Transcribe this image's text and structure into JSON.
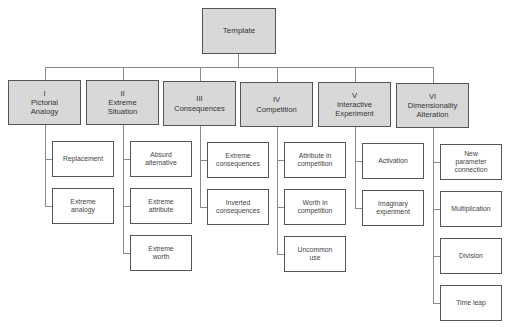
{
  "root": {
    "label": "Template"
  },
  "categories": [
    {
      "numeral": "I",
      "title": "Pictorial Analogy",
      "lines": [
        "I",
        "Pictorial",
        "Analogy"
      ],
      "children": [
        {
          "lines": [
            "Replacement"
          ]
        },
        {
          "lines": [
            "Extreme",
            "analogy"
          ]
        }
      ]
    },
    {
      "numeral": "II",
      "title": "Extreme Situation",
      "lines": [
        "II",
        "Extreme",
        "Situation"
      ],
      "children": [
        {
          "lines": [
            "Absurd",
            "alternative"
          ]
        },
        {
          "lines": [
            "Extreme",
            "attribute"
          ]
        },
        {
          "lines": [
            "Extreme",
            "worth"
          ]
        }
      ]
    },
    {
      "numeral": "III",
      "title": "Consequences",
      "lines": [
        "III",
        "Consequences"
      ],
      "children": [
        {
          "lines": [
            "Extreme",
            "consequences"
          ]
        },
        {
          "lines": [
            "Inverted",
            "consequences"
          ]
        }
      ]
    },
    {
      "numeral": "IV",
      "title": "Competition",
      "lines": [
        "IV",
        "Competition"
      ],
      "children": [
        {
          "lines": [
            "Attribute in",
            "competition"
          ]
        },
        {
          "lines": [
            "Worth in",
            "competition"
          ]
        },
        {
          "lines": [
            "Uncommon",
            "use"
          ]
        }
      ]
    },
    {
      "numeral": "V",
      "title": "Interactive Experiment",
      "lines": [
        "V",
        "Interactive",
        "Experiment"
      ],
      "children": [
        {
          "lines": [
            "Activation"
          ]
        },
        {
          "lines": [
            "Imaginary",
            "experiment"
          ]
        }
      ]
    },
    {
      "numeral": "VI",
      "title": "Dimensionality Alteration",
      "lines": [
        "VI",
        "Dimensionality",
        "Alteration"
      ],
      "children": [
        {
          "lines": [
            "New",
            "parameter",
            "connection"
          ]
        },
        {
          "lines": [
            "Multiplication"
          ]
        },
        {
          "lines": [
            "Division"
          ]
        },
        {
          "lines": [
            "Time leap"
          ]
        }
      ]
    }
  ],
  "colors": {
    "category_fill": "#d8d8d8",
    "border": "#555555",
    "connector": "#8a8a8a"
  }
}
